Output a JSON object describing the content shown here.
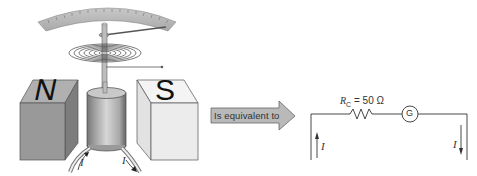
{
  "figure": {
    "meter": {
      "north_pole_label": "N",
      "south_pole_label": "S",
      "current_in_label": "I",
      "current_out_label": "I",
      "scale_color": "#b8b8b8",
      "north_color": "#9a9a9a",
      "south_color": "#efefef"
    },
    "equivalence_arrow": {
      "label": "Is equivalent to",
      "fill": "#b9b9b9"
    },
    "circuit": {
      "resistor_symbol": "R",
      "resistor_subscript": "C",
      "resistor_value": "= 50 Ω",
      "meter_symbol": "G",
      "current_left_label": "I",
      "current_right_label": "I"
    }
  }
}
